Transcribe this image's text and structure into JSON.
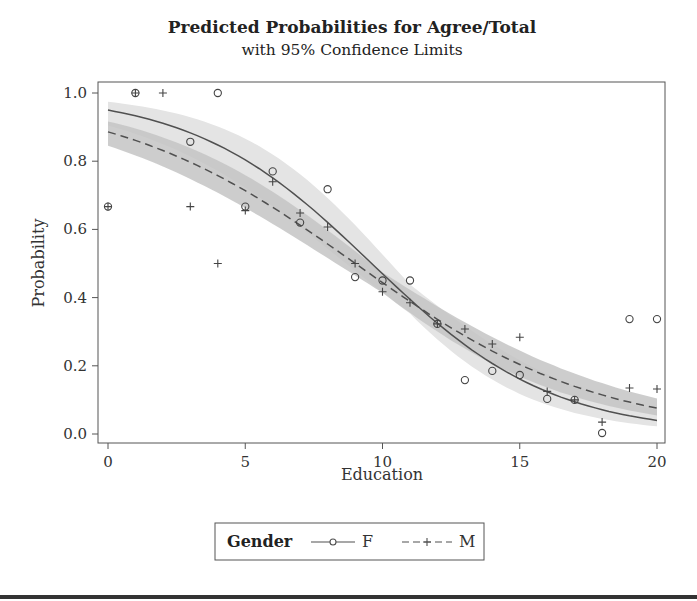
{
  "chart_data": {
    "type": "scatter",
    "title": "Predicted Probabilities for Agree/Total",
    "subtitle": "with 95% Confidence Limits",
    "xlabel": "Education",
    "ylabel": "Probability",
    "xlim": [
      0,
      20
    ],
    "ylim": [
      0.0,
      1.0
    ],
    "xticks": [
      0,
      5,
      10,
      15,
      20
    ],
    "xtick_labels": [
      "0",
      "5",
      "10",
      "15",
      "20"
    ],
    "yticks": [
      0.0,
      0.2,
      0.4,
      0.6,
      0.8,
      1.0
    ],
    "ytick_labels": [
      "0.0",
      "0.2",
      "0.4",
      "0.6",
      "0.8",
      "1.0"
    ],
    "grid": false,
    "legend": {
      "title": "Gender",
      "placement": "bottom-center",
      "entries": [
        {
          "label": "F",
          "line": "solid",
          "marker": "circle"
        },
        {
          "label": "M",
          "line": "dashed",
          "marker": "plus"
        }
      ]
    },
    "series": [
      {
        "name": "F",
        "marker": "circle",
        "line": "solid",
        "fit": {
          "model": "logistic",
          "intercept_logit": 2.94,
          "slope_logit": -0.306
        },
        "confidence": 0.95,
        "band_color": "#e4e4e4",
        "points": [
          {
            "x": 0,
            "y": 0.667
          },
          {
            "x": 1,
            "y": 1.0
          },
          {
            "x": 3,
            "y": 0.857
          },
          {
            "x": 4,
            "y": 1.0
          },
          {
            "x": 5,
            "y": 0.667
          },
          {
            "x": 6,
            "y": 0.77
          },
          {
            "x": 7,
            "y": 0.62
          },
          {
            "x": 8,
            "y": 0.718
          },
          {
            "x": 9,
            "y": 0.46
          },
          {
            "x": 10,
            "y": 0.45
          },
          {
            "x": 11,
            "y": 0.45
          },
          {
            "x": 12,
            "y": 0.323
          },
          {
            "x": 13,
            "y": 0.158
          },
          {
            "x": 14,
            "y": 0.185
          },
          {
            "x": 15,
            "y": 0.173
          },
          {
            "x": 16,
            "y": 0.103
          },
          {
            "x": 17,
            "y": 0.1
          },
          {
            "x": 18,
            "y": 0.003
          },
          {
            "x": 19,
            "y": 0.337
          },
          {
            "x": 20,
            "y": 0.337
          }
        ]
      },
      {
        "name": "M",
        "marker": "plus",
        "line": "dashed",
        "fit": {
          "model": "logistic",
          "intercept_logit": 2.05,
          "slope_logit": -0.2275
        },
        "confidence": 0.95,
        "band_color": "#c4c4c4",
        "points": [
          {
            "x": 0,
            "y": 0.667
          },
          {
            "x": 1,
            "y": 1.0
          },
          {
            "x": 2,
            "y": 1.0
          },
          {
            "x": 3,
            "y": 0.667
          },
          {
            "x": 4,
            "y": 0.5
          },
          {
            "x": 5,
            "y": 0.655
          },
          {
            "x": 6,
            "y": 0.74
          },
          {
            "x": 7,
            "y": 0.648
          },
          {
            "x": 8,
            "y": 0.607
          },
          {
            "x": 9,
            "y": 0.5
          },
          {
            "x": 10,
            "y": 0.417
          },
          {
            "x": 11,
            "y": 0.385
          },
          {
            "x": 12,
            "y": 0.323
          },
          {
            "x": 13,
            "y": 0.308
          },
          {
            "x": 14,
            "y": 0.264
          },
          {
            "x": 15,
            "y": 0.284
          },
          {
            "x": 16,
            "y": 0.125
          },
          {
            "x": 17,
            "y": 0.1
          },
          {
            "x": 18,
            "y": 0.035
          },
          {
            "x": 19,
            "y": 0.135
          },
          {
            "x": 20,
            "y": 0.132
          }
        ]
      }
    ]
  }
}
